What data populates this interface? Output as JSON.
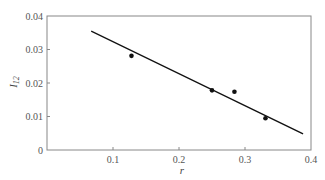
{
  "chart_data": {
    "type": "scatter",
    "title": "",
    "xlabel": "r",
    "ylabel": "I12",
    "ylabel_main": "I",
    "ylabel_sub": "12",
    "xlim": [
      0,
      0.4
    ],
    "ylim": [
      0,
      0.04
    ],
    "x_ticks": [
      0.1,
      0.2,
      0.3,
      0.4
    ],
    "x_tick_labels": [
      "0.1",
      "0.2",
      "0.3",
      "0.4"
    ],
    "y_ticks": [
      0,
      0.01,
      0.02,
      0.03,
      0.04
    ],
    "y_tick_labels": [
      "0",
      "0.01",
      "0.02",
      "0.03",
      "0.04"
    ],
    "grid": false,
    "legend": null,
    "series": [
      {
        "name": "data",
        "kind": "scatter",
        "x": [
          0.128,
          0.25,
          0.284,
          0.331
        ],
        "y": [
          0.0281,
          0.0178,
          0.0174,
          0.0095
        ]
      },
      {
        "name": "linear fit",
        "kind": "line",
        "x": [
          0.067,
          0.388
        ],
        "y": [
          0.0355,
          0.0048
        ]
      }
    ]
  },
  "colors": {
    "frame": "#888888",
    "line": "#111111",
    "points": "#111111",
    "text": "#555555"
  }
}
